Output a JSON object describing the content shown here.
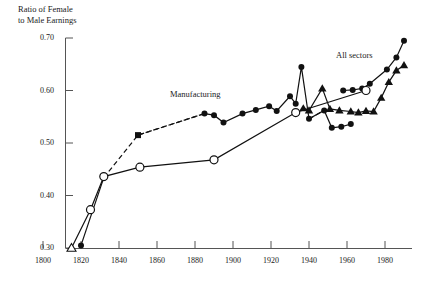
{
  "chart_data": {
    "type": "line",
    "title": "",
    "ylabel": "Ratio of Female to Male Earnings",
    "ylabel_line1": "Ratio of Female",
    "ylabel_line2": "to Male Earnings",
    "xlabel": "",
    "xlim": [
      1800,
      2000
    ],
    "ylim": [
      0.3,
      0.7
    ],
    "grid": false,
    "legend_position": "inline-annotations",
    "yticks": [
      0.3,
      0.4,
      0.5,
      0.6,
      0.7
    ],
    "ytick_labels": [
      "0.30",
      "0.40",
      "0.50",
      "0.60",
      "0.70"
    ],
    "xticks": [
      1800,
      1820,
      1840,
      1860,
      1880,
      1900,
      1920,
      1940,
      1960,
      1980
    ],
    "xtick_labels": [
      "1800",
      "1820",
      "1840",
      "1860",
      "1880",
      "1900",
      "1920",
      "1940",
      "1960",
      "1980"
    ],
    "annotations": [
      {
        "text": "Manufacturing",
        "x": 1888,
        "y": 0.605
      },
      {
        "text": "All sectors",
        "x": 1974,
        "y": 0.676
      }
    ],
    "series": [
      {
        "name": "Manufacturing",
        "marker": "circle-filled",
        "linestyle": "dashed-early-solid-late",
        "points": [
          {
            "x": 1820,
            "y": 0.305,
            "marker": "circle-filled"
          },
          {
            "x": 1832,
            "y": 0.434,
            "marker": "circle-filled"
          },
          {
            "x": 1850,
            "y": 0.515,
            "marker": "square-filled"
          },
          {
            "x": 1885,
            "y": 0.556,
            "marker": "circle-filled"
          },
          {
            "x": 1890,
            "y": 0.553,
            "marker": "circle-filled"
          },
          {
            "x": 1895,
            "y": 0.539,
            "marker": "circle-filled"
          },
          {
            "x": 1905,
            "y": 0.556,
            "marker": "circle-filled"
          },
          {
            "x": 1912,
            "y": 0.563,
            "marker": "circle-filled"
          },
          {
            "x": 1919,
            "y": 0.57,
            "marker": "circle-filled"
          },
          {
            "x": 1923,
            "y": 0.561,
            "marker": "circle-filled"
          },
          {
            "x": 1930,
            "y": 0.589,
            "marker": "circle-filled"
          },
          {
            "x": 1933,
            "y": 0.575,
            "marker": "circle-filled"
          },
          {
            "x": 1936,
            "y": 0.645,
            "marker": "circle-filled"
          },
          {
            "x": 1940,
            "y": 0.546,
            "marker": "circle-filled"
          },
          {
            "x": 1948,
            "y": 0.562,
            "marker": "circle-filled"
          },
          {
            "x": 1952,
            "y": 0.529,
            "marker": "circle-filled"
          },
          {
            "x": 1957,
            "y": 0.531,
            "marker": "circle-filled"
          },
          {
            "x": 1962,
            "y": 0.536,
            "marker": "circle-filled"
          }
        ]
      },
      {
        "name": "Manufacturing-modern",
        "marker": "circle-filled",
        "linestyle": "solid",
        "points": [
          {
            "x": 1958,
            "y": 0.6,
            "marker": "circle-filled"
          },
          {
            "x": 1963,
            "y": 0.601,
            "marker": "circle-filled"
          },
          {
            "x": 1968,
            "y": 0.604,
            "marker": "circle-filled"
          },
          {
            "x": 1972,
            "y": 0.613,
            "marker": "circle-filled"
          },
          {
            "x": 1981,
            "y": 0.64,
            "marker": "circle-filled"
          },
          {
            "x": 1986,
            "y": 0.663,
            "marker": "circle-filled"
          },
          {
            "x": 1990,
            "y": 0.695,
            "marker": "circle-filled"
          }
        ]
      },
      {
        "name": "Benchmark-open",
        "marker": "circle-open",
        "linestyle": "solid",
        "points": [
          {
            "x": 1815,
            "y": 0.3,
            "marker": "triangle-open"
          },
          {
            "x": 1825,
            "y": 0.373,
            "marker": "circle-open"
          },
          {
            "x": 1832,
            "y": 0.436,
            "marker": "circle-open"
          },
          {
            "x": 1851,
            "y": 0.454,
            "marker": "circle-open"
          },
          {
            "x": 1890,
            "y": 0.468,
            "marker": "circle-open"
          },
          {
            "x": 1933,
            "y": 0.558,
            "marker": "circle-open"
          },
          {
            "x": 1970,
            "y": 0.6,
            "marker": "circle-open"
          }
        ]
      },
      {
        "name": "All sectors",
        "marker": "triangle-filled",
        "linestyle": "solid",
        "points": [
          {
            "x": 1937,
            "y": 0.566,
            "marker": "triangle-filled"
          },
          {
            "x": 1940,
            "y": 0.562,
            "marker": "triangle-filled"
          },
          {
            "x": 1947,
            "y": 0.604,
            "marker": "triangle-filled"
          },
          {
            "x": 1951,
            "y": 0.565,
            "marker": "triangle-filled"
          },
          {
            "x": 1956,
            "y": 0.562,
            "marker": "triangle-filled"
          },
          {
            "x": 1962,
            "y": 0.56,
            "marker": "triangle-filled"
          },
          {
            "x": 1966,
            "y": 0.558,
            "marker": "triangle-filled"
          },
          {
            "x": 1970,
            "y": 0.561,
            "marker": "triangle-filled"
          },
          {
            "x": 1974,
            "y": 0.56,
            "marker": "triangle-filled"
          },
          {
            "x": 1978,
            "y": 0.586,
            "marker": "triangle-filled"
          },
          {
            "x": 1982,
            "y": 0.616,
            "marker": "triangle-filled"
          },
          {
            "x": 1986,
            "y": 0.638,
            "marker": "triangle-filled"
          },
          {
            "x": 1990,
            "y": 0.648,
            "marker": "triangle-filled"
          }
        ]
      }
    ],
    "colors": {
      "line": "#111111",
      "marker_fill": "#111111",
      "marker_open_fill": "#ffffff",
      "axis": "#555555",
      "background": "#ffffff"
    }
  }
}
